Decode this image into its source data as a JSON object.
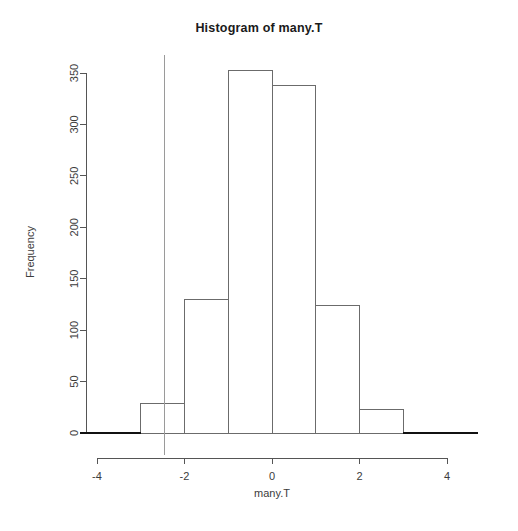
{
  "chart_data": {
    "type": "bar",
    "title": "Histogram of many.T",
    "xlabel": "many.T",
    "ylabel": "Frequency",
    "bin_edges": [
      -3,
      -2,
      -1,
      0,
      1,
      2,
      3
    ],
    "categories": [
      "-3 to -2",
      "-2 to -1",
      "-1 to 0",
      "0 to 1",
      "1 to 2",
      "2 to 3"
    ],
    "values": [
      29,
      130,
      352,
      338,
      124,
      23
    ],
    "xlim": [
      -4.4,
      4.7
    ],
    "ylim": [
      0,
      365
    ],
    "xticks": [
      -4,
      -2,
      0,
      2,
      4
    ],
    "xtick_labels": [
      "-4",
      "-2",
      "0",
      "2",
      "4"
    ],
    "yticks": [
      0,
      50,
      100,
      150,
      200,
      250,
      300,
      350
    ],
    "ytick_labels": [
      "0",
      "50",
      "100",
      "150",
      "200",
      "250",
      "300",
      "350"
    ],
    "grid": false,
    "legend": "none",
    "annotations": [
      {
        "name": "vertical-reference-line",
        "type": "vline",
        "x": -2.45,
        "color": "#9a9a9a"
      }
    ],
    "bar_fill_color": "#ffffff",
    "bar_stroke_color": "#6b6b6b",
    "baseline_color": "#111111"
  }
}
